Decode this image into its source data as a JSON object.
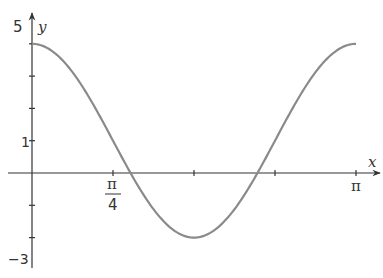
{
  "chart_data": {
    "type": "line",
    "title": "",
    "function": "y = 1 + 3cos(2x)",
    "xlabel": "x",
    "ylabel": "y",
    "xlim": [
      0,
      3.14159
    ],
    "ylim": [
      -3,
      5
    ],
    "x_ticks": [
      0.7854,
      1.5708,
      2.3562,
      3.14159
    ],
    "x_tick_labels": [
      {
        "value": 0.7854,
        "numerator": "π",
        "denominator": "4"
      },
      {
        "value": 3.14159,
        "text": "π"
      }
    ],
    "y_ticks": [
      -2,
      -1,
      1,
      2,
      3,
      4
    ],
    "y_tick_labels": [
      {
        "value": 5,
        "text": "5"
      },
      {
        "value": 1,
        "text": "1"
      },
      {
        "value": -3,
        "text": "−3"
      }
    ],
    "grid": false,
    "legend": null,
    "series": [
      {
        "name": "curve",
        "color": "#8a8a8a",
        "x": [
          0,
          0.3927,
          0.7854,
          0.9553,
          1.1781,
          1.5708,
          1.9635,
          2.1863,
          2.3562,
          2.7489,
          3.14159
        ],
        "values": [
          4,
          3.121,
          1,
          0,
          -1.121,
          -2,
          -1.121,
          0,
          1,
          3.121,
          4
        ]
      }
    ]
  },
  "labels": {
    "x_axis": "x",
    "y_axis": "y",
    "y_top": "5",
    "y_one": "1",
    "y_bottom": "−3",
    "x_pi": "π",
    "x_pi4_num": "π",
    "x_pi4_den": "4"
  },
  "colors": {
    "axis": "#333333",
    "curve": "#8a8a8a"
  }
}
